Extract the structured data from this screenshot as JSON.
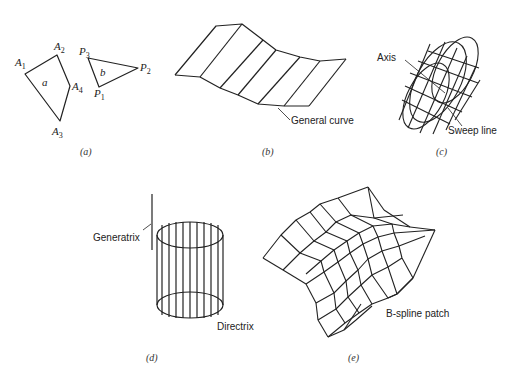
{
  "panels": {
    "a": {
      "caption": "(a)",
      "polygon_a": {
        "label": "a",
        "vertices": [
          "A1",
          "A2",
          "A4",
          "A3"
        ]
      },
      "polygon_b": {
        "label": "b",
        "vertices": [
          "P1",
          "P2",
          "P3"
        ]
      },
      "vertex_labels": {
        "A1": {
          "main": "A",
          "sub": "1"
        },
        "A2": {
          "main": "A",
          "sub": "2"
        },
        "A3": {
          "main": "A",
          "sub": "3"
        },
        "A4": {
          "main": "A",
          "sub": "4"
        },
        "P1": {
          "main": "P",
          "sub": "1"
        },
        "P2": {
          "main": "P",
          "sub": "2"
        },
        "P3": {
          "main": "P",
          "sub": "3"
        }
      }
    },
    "b": {
      "caption": "(b)",
      "callout": "General curve"
    },
    "c": {
      "caption": "(c)",
      "callout_axis": "Axis",
      "callout_sweep": "Sweep line"
    },
    "d": {
      "caption": "(d)",
      "callout_generatrix": "Generatrix",
      "callout_directrix": "Directrix"
    },
    "e": {
      "caption": "(e)",
      "callout": "B-spline patch"
    }
  },
  "colors": {
    "stroke": "#222222",
    "background": "#ffffff"
  }
}
